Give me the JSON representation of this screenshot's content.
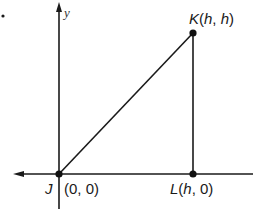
{
  "diagram": {
    "type": "coordinate-geometry",
    "axes": {
      "y_label": "y",
      "x_label": ""
    },
    "bullet": "•",
    "points": [
      {
        "id": "J",
        "name": "J",
        "coords": "(0, 0)",
        "label_suffix": "(0, 0)"
      },
      {
        "id": "K",
        "name": "K",
        "coords": "(h, h)",
        "label_open": "(",
        "label_var1": "h",
        "label_sep": ", ",
        "label_var2": "h",
        "label_close": ")"
      },
      {
        "id": "L",
        "name": "L",
        "coords": "(h, 0)",
        "label_open": "(",
        "label_var1": "h",
        "label_rest": ", 0)"
      }
    ],
    "segments": [
      {
        "from": "J",
        "to": "K"
      },
      {
        "from": "K",
        "to": "L"
      },
      {
        "from": "J",
        "to": "L"
      }
    ],
    "colors": {
      "line": "#1a1a1a",
      "point": "#111111",
      "background": "#ffffff"
    }
  }
}
